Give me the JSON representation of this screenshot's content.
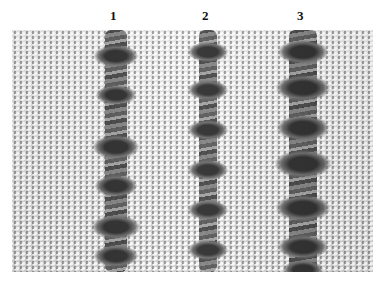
{
  "figure": {
    "type": "photograph",
    "labels": [
      "1",
      "2",
      "3"
    ],
    "columns": [
      {
        "label": "1",
        "center_x": 104,
        "core_width": 22,
        "knots_y": [
          20,
          60,
          110,
          150,
          190,
          220
        ]
      },
      {
        "label": "2",
        "center_x": 196,
        "core_width": 18,
        "knots_y": [
          18,
          55,
          95,
          135,
          175,
          215
        ]
      },
      {
        "label": "3",
        "center_x": 291,
        "core_width": 28,
        "knots_y": [
          15,
          50,
          90,
          125,
          170,
          210,
          235
        ]
      }
    ]
  }
}
